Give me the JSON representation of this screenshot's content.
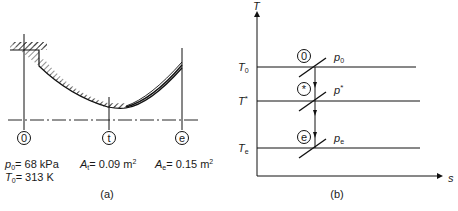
{
  "panel_a": {
    "caption": "(a)",
    "stations": [
      {
        "id": "0",
        "label": "0"
      },
      {
        "id": "t",
        "label": "t"
      },
      {
        "id": "e",
        "label": "e"
      }
    ],
    "inlet": {
      "p_sym": "p",
      "p_sub": "0",
      "p_val": "= 68 kPa",
      "T_sym": "T",
      "T_sub": "0",
      "T_val": "= 313 K"
    },
    "throat": {
      "sym": "A",
      "sub": "t",
      "val": "= 0.09 m",
      "sup": "2"
    },
    "exit": {
      "sym": "A",
      "sub": "e",
      "val": "= 0.15 m",
      "sup": "2"
    }
  },
  "panel_b": {
    "caption": "(b)",
    "y_axis": "T",
    "x_axis": "s",
    "levels": [
      {
        "T_sym": "T",
        "T_sub": "0",
        "T_sup": "",
        "state": "0",
        "p_sym": "p",
        "p_sub": "0",
        "p_sup": ""
      },
      {
        "T_sym": "T",
        "T_sub": "",
        "T_sup": "*",
        "state": "*",
        "p_sym": "p",
        "p_sub": "",
        "p_sup": "*"
      },
      {
        "T_sym": "T",
        "T_sub": "e",
        "T_sup": "",
        "state": "e",
        "p_sym": "p",
        "p_sub": "e",
        "p_sup": ""
      }
    ]
  }
}
